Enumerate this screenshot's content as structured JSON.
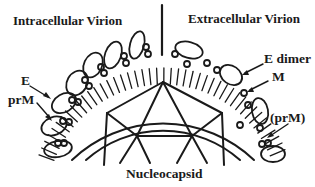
{
  "diagram": {
    "type": "virion-structure-schematic",
    "left_title": "Intracellular Virion",
    "right_title": "Extracellular Virion",
    "labels": {
      "e": "E",
      "prm": "prM",
      "e_dimer": "E dimer",
      "m": "M",
      "prm_paren": "(prM)",
      "nucleocapsid": "Nucleocapsid"
    },
    "colors": {
      "stroke": "#1a1a1a",
      "background": "#ffffff"
    }
  }
}
